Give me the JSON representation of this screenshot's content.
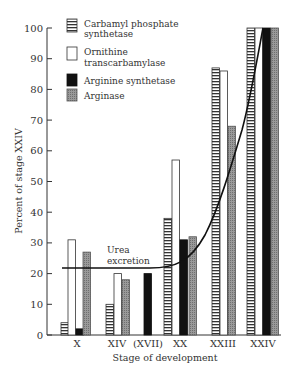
{
  "chart_data": {
    "type": "bar",
    "title": "",
    "xlabel": "Stage of development",
    "ylabel": "Percent of stage XXIV",
    "ylim": [
      0,
      100
    ],
    "yticks": [
      0,
      10,
      20,
      30,
      40,
      50,
      60,
      70,
      80,
      90,
      100
    ],
    "categories": [
      "X",
      "XIV",
      "(XVII)",
      "XX",
      "XXIII",
      "XXIV"
    ],
    "series": [
      {
        "name": "Carbamyl phosphate synthetase",
        "pattern": "horizontal-stripes",
        "color": "#ffffff",
        "values": [
          4,
          10,
          null,
          38,
          87,
          100
        ]
      },
      {
        "name": "Ornithine transcarbamylase",
        "pattern": "open",
        "color": "#ffffff",
        "values": [
          31,
          20,
          null,
          57,
          86,
          100
        ]
      },
      {
        "name": "Arginine synthetase",
        "pattern": "solid",
        "color": "#111111",
        "values": [
          2,
          0,
          20,
          31,
          0,
          100
        ]
      },
      {
        "name": "Arginase",
        "pattern": "stippled-gray",
        "color": "#8a8a8a",
        "values": [
          27,
          18,
          null,
          32,
          68,
          100
        ]
      }
    ],
    "overlay_line": {
      "name": "Urea excretion",
      "type": "curve",
      "points": [
        [
          0,
          22
        ],
        [
          1,
          22
        ],
        [
          2,
          22
        ],
        [
          3,
          25
        ],
        [
          4,
          60
        ],
        [
          5,
          100
        ]
      ]
    },
    "legend": {
      "position": "upper-left",
      "entries": [
        "Carbamyl phosphate synthetase",
        "Ornithine transcarbamylase",
        "Arginine synthetase",
        "Arginase"
      ]
    },
    "grid": false
  },
  "legend": {
    "items": [
      {
        "line1": "Carbamyl phosphate",
        "line2": "synthetase"
      },
      {
        "line1": "Ornithine",
        "line2": "transcarbamylase"
      },
      {
        "line1": "Arginine synthetase",
        "line2": ""
      },
      {
        "line1": "Arginase",
        "line2": ""
      }
    ]
  },
  "annotation": {
    "line1": "Urea",
    "line2": "excretion"
  },
  "axes": {
    "ylabel": "Percent of stage XXIV",
    "xlabel": "Stage of development",
    "yticks": [
      "0",
      "10",
      "20",
      "30",
      "40",
      "50",
      "60",
      "70",
      "80",
      "90",
      "100"
    ],
    "xticks": [
      "X",
      "XIV",
      "(XVII)",
      "XX",
      "XXIII",
      "XXIV"
    ]
  }
}
